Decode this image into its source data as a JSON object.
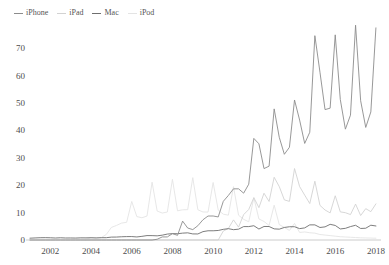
{
  "chart_data": {
    "type": "line",
    "title": "",
    "xlabel": "",
    "ylabel": "",
    "xlim": [
      2001.0,
      2018.25
    ],
    "ylim": [
      0,
      78
    ],
    "grid": false,
    "legend_position": "top-left",
    "xticks": [
      2002,
      2004,
      2006,
      2008,
      2010,
      2012,
      2014,
      2016,
      2018
    ],
    "xtick_labels": [
      "2002",
      "2004",
      "2006",
      "2008",
      "2010",
      "2012",
      "2014",
      "2016",
      "2018"
    ],
    "yticks": [
      0,
      10,
      20,
      30,
      40,
      50,
      60,
      70
    ],
    "ytick_labels": [
      "0",
      "10",
      "20",
      "30",
      "40",
      "50",
      "60",
      "70"
    ],
    "x": [
      2001.0,
      2001.25,
      2001.5,
      2001.75,
      2002.0,
      2002.25,
      2002.5,
      2002.75,
      2003.0,
      2003.25,
      2003.5,
      2003.75,
      2004.0,
      2004.25,
      2004.5,
      2004.75,
      2005.0,
      2005.25,
      2005.5,
      2005.75,
      2006.0,
      2006.25,
      2006.5,
      2006.75,
      2007.0,
      2007.25,
      2007.5,
      2007.75,
      2008.0,
      2008.25,
      2008.5,
      2008.75,
      2009.0,
      2009.25,
      2009.5,
      2009.75,
      2010.0,
      2010.25,
      2010.5,
      2010.75,
      2011.0,
      2011.25,
      2011.5,
      2011.75,
      2012.0,
      2012.25,
      2012.5,
      2012.75,
      2013.0,
      2013.25,
      2013.5,
      2013.75,
      2014.0,
      2014.25,
      2014.5,
      2014.75,
      2015.0,
      2015.25,
      2015.5,
      2015.75,
      2016.0,
      2016.25,
      2016.5,
      2016.75,
      2017.0,
      2017.25,
      2017.5,
      2017.75,
      2018.0
    ],
    "series": [
      {
        "name": "iPhone",
        "color": "#8c8c8c",
        "values": [
          0,
          0,
          0,
          0,
          0,
          0,
          0,
          0,
          0,
          0,
          0,
          0,
          0,
          0,
          0,
          0,
          0,
          0,
          0,
          0,
          0,
          0,
          0,
          0,
          0,
          0.27,
          1.12,
          1.12,
          2.32,
          1.7,
          6.89,
          4.36,
          3.79,
          5.21,
          7.37,
          8.74,
          8.75,
          8.4,
          14.1,
          16.24,
          18.65,
          18.65,
          17.07,
          20.34,
          37.04,
          35.06,
          26.03,
          26.91,
          47.79,
          37.43,
          31.24,
          33.8,
          51.03,
          43.72,
          35.2,
          39.27,
          74.47,
          61.17,
          47.53,
          48.05,
          74.78,
          51.19,
          40.4,
          45.51,
          78.29,
          50.76,
          41.03,
          46.68,
          77.32
        ]
      },
      {
        "name": "iPad",
        "color": "#d2d2d2",
        "values": [
          0,
          0,
          0,
          0,
          0,
          0,
          0,
          0,
          0,
          0,
          0,
          0,
          0,
          0,
          0,
          0,
          0,
          0,
          0,
          0,
          0,
          0,
          0,
          0,
          0,
          0,
          0,
          0,
          0,
          0,
          0,
          0,
          0,
          0,
          0,
          0,
          0,
          0,
          3.27,
          4.19,
          7.33,
          4.69,
          9.25,
          11.12,
          15.43,
          11.8,
          17.04,
          14.04,
          22.86,
          19.48,
          14.62,
          14.08,
          26.04,
          19.48,
          16.35,
          13.28,
          21.42,
          12.62,
          10.93,
          9.88,
          16.12,
          10.25,
          9.95,
          9.27,
          13.08,
          8.92,
          11.42,
          10.33,
          13.17
        ]
      },
      {
        "name": "Mac",
        "color": "#6e6e6e",
        "values": [
          0.66,
          0.75,
          0.83,
          0.85,
          0.81,
          0.72,
          0.81,
          0.73,
          0.74,
          0.71,
          0.79,
          0.78,
          0.83,
          0.75,
          0.84,
          0.84,
          1.05,
          1.07,
          1.18,
          1.24,
          1.25,
          1.11,
          1.33,
          1.61,
          1.6,
          1.52,
          1.76,
          2.16,
          2.32,
          2.29,
          2.5,
          2.61,
          2.22,
          2.2,
          3.05,
          3.36,
          3.36,
          3.47,
          3.89,
          4.13,
          3.76,
          3.95,
          4.89,
          4.89,
          5.2,
          4.0,
          4.93,
          4.92,
          4.06,
          3.95,
          4.57,
          4.83,
          4.84,
          4.14,
          4.41,
          5.52,
          5.52,
          4.56,
          4.79,
          5.71,
          5.31,
          4.03,
          4.25,
          4.89,
          5.37,
          4.2,
          4.29,
          5.39,
          5.11
        ]
      },
      {
        "name": "iPod",
        "color": "#e4e4e4",
        "values": [
          0,
          0,
          0,
          0.125,
          0.057,
          0.054,
          0.14,
          0.14,
          0.22,
          0.27,
          0.3,
          0.34,
          0.73,
          0.81,
          0.86,
          2.02,
          4.58,
          5.31,
          6.16,
          6.45,
          14.04,
          8.53,
          8.11,
          8.73,
          21.07,
          10.55,
          9.82,
          10.2,
          22.12,
          10.64,
          11.01,
          11.05,
          22.73,
          11.01,
          10.22,
          10.18,
          20.97,
          10.89,
          9.41,
          9.05,
          19.45,
          9.02,
          7.54,
          6.62,
          15.4,
          7.67,
          6.75,
          5.29,
          12.68,
          5.63,
          4.57,
          3.5,
          6.05,
          2.76,
          2.93,
          2.64,
          2.5,
          2.0,
          1.8,
          1.6,
          1.4,
          1.2,
          1.1,
          1.0,
          0.9,
          0.8,
          0.75,
          0.7,
          0.65
        ]
      }
    ]
  },
  "legend": {
    "items": [
      {
        "label": "iPhone",
        "color": "#8c8c8c"
      },
      {
        "label": "iPad",
        "color": "#d2d2d2"
      },
      {
        "label": "Mac",
        "color": "#6e6e6e"
      },
      {
        "label": "iPod",
        "color": "#e4e4e4"
      }
    ]
  },
  "axes": {
    "axis_color": "#bfbfbf",
    "tick_color": "#4d4d4d"
  }
}
